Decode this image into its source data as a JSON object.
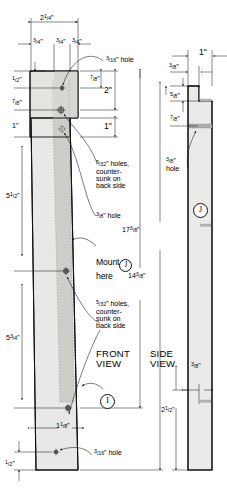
{
  "drawing": {
    "title": "Part I / J woodworking plan",
    "views": [
      {
        "name": "front-view",
        "label": "FRONT\nVIEW",
        "label_line1": "FRONT",
        "label_line2": "VIEW",
        "part_letter": "I"
      },
      {
        "name": "side-view",
        "label": "SIDE\nVIEW",
        "label_line1": "SIDE",
        "label_line2": "VIEW",
        "part_letter": "J"
      }
    ],
    "colors": {
      "outline": "#111111",
      "face_light": "#e8e8e6",
      "face_mid": "#d8d8d5",
      "face_dark": "#c6c6c2",
      "hidden_line": "#8d8d8a",
      "dim_line": "#111111",
      "background": "#ffffff"
    },
    "dimensions": {
      "overall_width": {
        "num": "2",
        "frac_n": "1",
        "frac_d": "4",
        "unit": "\""
      },
      "seg_a": {
        "num": "",
        "frac_n": "3",
        "frac_d": "4",
        "unit": "\""
      },
      "seg_b": {
        "num": "",
        "frac_n": "3",
        "frac_d": "4",
        "unit": "\""
      },
      "seg_c": {
        "num": "",
        "frac_n": "3",
        "frac_d": "4",
        "unit": "\""
      },
      "top_half": {
        "num": "",
        "frac_n": "1",
        "frac_d": "2",
        "unit": "\""
      },
      "seven_eighths_left": {
        "num": "",
        "frac_n": "7",
        "frac_d": "8",
        "unit": "\""
      },
      "one_inch_left": {
        "num": "1",
        "frac_n": "",
        "frac_d": "",
        "unit": "\""
      },
      "seven_eighths_right": {
        "num": "",
        "frac_n": "7",
        "frac_d": "8",
        "unit": "\""
      },
      "two_inch": {
        "num": "2",
        "frac_n": "",
        "frac_d": "",
        "unit": "\""
      },
      "one_inch_right": {
        "num": "1",
        "frac_n": "",
        "frac_d": "",
        "unit": "\""
      },
      "five_and_half": {
        "num": "5",
        "frac_n": "1",
        "frac_d": "2",
        "unit": "\""
      },
      "five_and_three_quarter": {
        "num": "5",
        "frac_n": "3",
        "frac_d": "4",
        "unit": "\""
      },
      "fourteen_three_eighths": {
        "num": "14",
        "frac_n": "3",
        "frac_d": "8",
        "unit": "\""
      },
      "seventeen_three_eighths": {
        "num": "17",
        "frac_n": "3",
        "frac_d": "8",
        "unit": "\""
      },
      "one_and_one_eighth": {
        "num": "1",
        "frac_n": "1",
        "frac_d": "8",
        "unit": "\""
      },
      "bottom_half": {
        "num": "",
        "frac_n": "1",
        "frac_d": "2",
        "unit": "\""
      },
      "side_one_inch": {
        "num": "1",
        "frac_n": "",
        "frac_d": "",
        "unit": "\""
      },
      "side_three_eighths_top": {
        "num": "",
        "frac_n": "3",
        "frac_d": "8",
        "unit": "\""
      },
      "side_five_eighths": {
        "num": "",
        "frac_n": "5",
        "frac_d": "8",
        "unit": "\""
      },
      "side_seven_eighths": {
        "num": "",
        "frac_n": "7",
        "frac_d": "8",
        "unit": "\""
      },
      "side_three_eighths_bottom": {
        "num": "",
        "frac_n": "3",
        "frac_d": "8",
        "unit": "\""
      },
      "side_two_and_half": {
        "num": "2",
        "frac_n": "1",
        "frac_d": "2",
        "unit": "\""
      }
    },
    "notes": {
      "hole_three_sixteenths_top": {
        "frac_n": "3",
        "frac_d": "16",
        "text": "\" hole"
      },
      "hole_three_sixteenths_bottom": {
        "frac_n": "3",
        "frac_d": "16",
        "text": "\" hole"
      },
      "hole_three_eighths_front": {
        "frac_n": "3",
        "frac_d": "8",
        "text": "\" hole"
      },
      "hole_three_eighths_side_l1": {
        "frac_n": "3",
        "frac_d": "8",
        "text": "\""
      },
      "hole_three_eighths_side_l2": "hole",
      "countersunk_upper": {
        "frac_n": "5",
        "frac_d": "32",
        "line1": "\" holes,",
        "line2": "counter-",
        "line3": "sunk on",
        "line4": "back side"
      },
      "countersunk_lower": {
        "frac_n": "5",
        "frac_d": "32",
        "line1": "\" holes,",
        "line2": "counter-",
        "line3": "sunk on",
        "line4": "back side"
      },
      "mount_line1": "Mount",
      "mount_line2": "here",
      "mount_part": "J"
    }
  }
}
